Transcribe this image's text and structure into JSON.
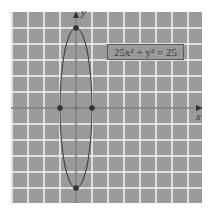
{
  "chart_data": {
    "type": "line",
    "title": "",
    "equation": "25x² + y² = 25",
    "xlabel": "x",
    "ylabel": "y",
    "curve": "ellipse",
    "center": [
      0,
      0
    ],
    "semi_axis_x": 1,
    "semi_axis_y": 5,
    "points": [
      {
        "x": 0,
        "y": 5
      },
      {
        "x": 0,
        "y": -5
      },
      {
        "x": -1,
        "y": 0
      },
      {
        "x": 1,
        "y": 0
      }
    ],
    "xlim": [
      -4,
      8
    ],
    "ylim": [
      -6,
      6
    ],
    "grid": true,
    "grid_spacing": 1,
    "colors": {
      "background": "#9a9a9a",
      "grid": "#ffffff",
      "curve": "#333333",
      "axes": "#333333"
    }
  },
  "labels": {
    "equation": "25x² + y² = 25",
    "x_axis": "x",
    "y_axis": "y"
  }
}
